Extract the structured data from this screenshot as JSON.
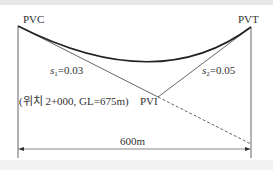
{
  "diagram": {
    "points": {
      "pvc": "PVC",
      "pvt": "PVT",
      "pvi": "PVI"
    },
    "slopes": {
      "s1_var": "s",
      "s1_sub": "1",
      "s1_val": "=0.03",
      "s2_var": "s",
      "s2_sub": "2",
      "s2_val": "=0.05"
    },
    "pvi_note": "(위치 2+000, GL=675m)",
    "length_label": "600m",
    "colors": {
      "line": "#555555",
      "curve": "#222222",
      "text": "#333333"
    }
  }
}
